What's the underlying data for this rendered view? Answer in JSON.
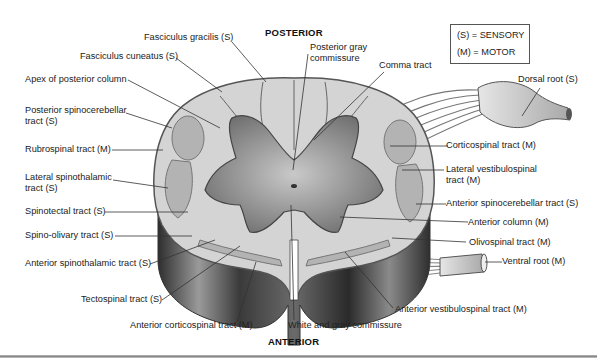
{
  "diagram": {
    "title_top": "POSTERIOR",
    "title_bottom": "ANTERIOR",
    "legend": {
      "sensory": "(S) = SENSORY",
      "motor": "(M) = MOTOR"
    },
    "labels_left": [
      {
        "text": "Fasciculus gracilis (S)"
      },
      {
        "text": "Fasciculus cuneatus (S)"
      },
      {
        "text": "Apex of posterior column"
      },
      {
        "text": "Posterior spinocerebellar",
        "text2": "tract (S)"
      },
      {
        "text": "Rubrospinal tract (M)"
      },
      {
        "text": "Lateral spinothalamic",
        "text2": "tract (S)"
      },
      {
        "text": "Spinotectal tract (S)"
      },
      {
        "text": "Spino-olivary tract (S)"
      },
      {
        "text": "Anterior spinothalamic tract (S)"
      },
      {
        "text": "Tectospinal tract (S)"
      },
      {
        "text": "Anterior corticospinal tract (M)"
      }
    ],
    "labels_top": [
      {
        "text": "Posterior gray",
        "text2": "commissure"
      },
      {
        "text": "Comma tract"
      }
    ],
    "labels_right": [
      {
        "text": "Dorsal root (S)"
      },
      {
        "text": "Corticospinal tract (M)"
      },
      {
        "text": "Lateral vestibulospinal",
        "text2": "tract (M)"
      },
      {
        "text": "Anterior spinocerebellar tract (S)"
      },
      {
        "text": "Anterior column (M)"
      },
      {
        "text": "Olivospinal tract (M)"
      },
      {
        "text": "Ventral root (M)"
      },
      {
        "text": "Anterior vestibulospinal tract (M)"
      }
    ],
    "labels_bottom": [
      {
        "text": "White and gray commissure"
      }
    ],
    "colors": {
      "white_matter": "#d4d4d4",
      "gray_matter": "#8a8a8a",
      "tract_region": "#b3b3b3",
      "outline": "#555555",
      "side_dark": "#3a3a3a"
    }
  }
}
